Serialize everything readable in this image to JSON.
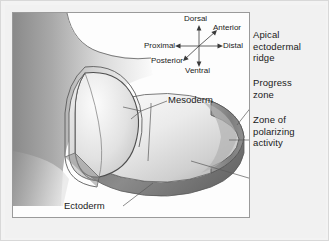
{
  "figure": {
    "background_color": "#f1f1f1",
    "frame_color": "#9a9a9a",
    "ink_color": "#1a1a1a"
  },
  "compass": {
    "name": "body-axes-compass",
    "center": {
      "x": 198,
      "y": 45
    },
    "labels": {
      "dorsal": "Dorsal",
      "ventral": "Ventral",
      "proximal": "Proximal",
      "distal": "Distal",
      "anterior": "Anterior",
      "posterior": "Posterior"
    }
  },
  "structure_labels": {
    "mesoderm": "Mesoderm",
    "ectoderm": "Ectoderm"
  },
  "captions": {
    "apical_ectodermal_ridge": [
      "Apical",
      "ectodermal",
      "ridge"
    ],
    "progress_zone": [
      "Progress",
      "zone"
    ],
    "zone_of_polarizing_activity": [
      "Zone of",
      "polarizing",
      "activity"
    ]
  },
  "shading": {
    "body_wall_dark": "#8d8d8d",
    "body_wall_light": "#ffffff",
    "mesoderm_fill_light": "#f4f4f4",
    "mesoderm_fill_mid": "#d2d2d2",
    "ectoderm_rim_dark": "#7f7f7f",
    "cut_face_light": "#fafafa",
    "cut_face_mid": "#cfcfcf",
    "outline": "#4a4a4a"
  }
}
